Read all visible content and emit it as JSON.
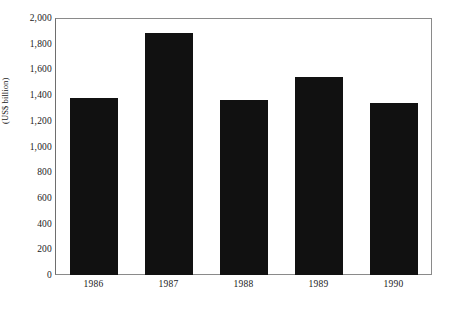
{
  "chart_data": {
    "type": "bar",
    "title": "",
    "subtitle": "",
    "xlabel": "",
    "ylabel": "(US$ billion)",
    "categories": [
      "1986",
      "1987",
      "1988",
      "1989",
      "1990"
    ],
    "values": [
      1385,
      1890,
      1370,
      1550,
      1340
    ],
    "series": [
      {
        "name": "",
        "values": [
          1385,
          1890,
          1370,
          1550,
          1340
        ]
      }
    ],
    "ylim": [
      0,
      2000
    ],
    "ytick_values": [
      0,
      200,
      400,
      600,
      800,
      1000,
      1200,
      1400,
      1600,
      1800,
      2000
    ],
    "ytick_labels": [
      "0",
      "200",
      "400",
      "600",
      "800",
      "1,000",
      "1,200",
      "1,400",
      "1,600",
      "1,800",
      "2,000"
    ],
    "grid": false,
    "legend": false,
    "legend_position": "none",
    "bar_color": "#111111",
    "frame_color": "#8a8a8a",
    "background_color": "#ffffff",
    "annotations": []
  }
}
